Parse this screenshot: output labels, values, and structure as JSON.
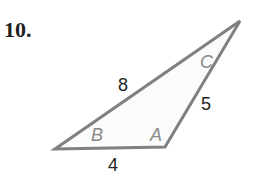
{
  "problem": {
    "number": "10.",
    "figure": {
      "type": "triangle",
      "vertices": {
        "B": [
          55,
          149
        ],
        "A": [
          165,
          147
        ],
        "C": [
          240,
          21
        ]
      },
      "vertex_labels": {
        "A": "A",
        "B": "B",
        "C": "C"
      },
      "side_labels": {
        "AB": "4",
        "AC": "5",
        "BC": "8"
      },
      "stroke_color": "#808080",
      "label_color": "#8a8a8a",
      "text_color": "#231f20"
    }
  }
}
